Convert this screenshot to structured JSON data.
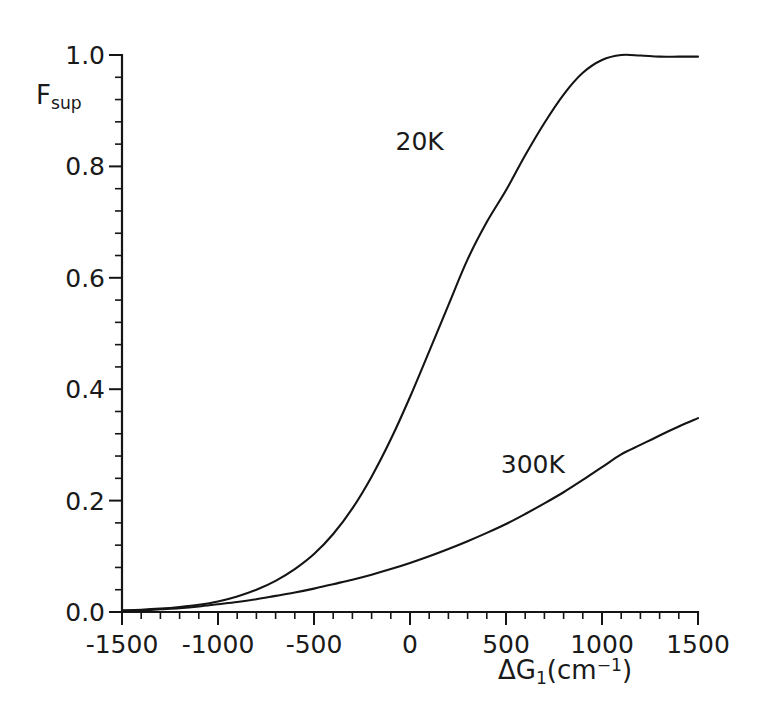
{
  "chart_data": {
    "type": "line",
    "title": "",
    "subtitle": "",
    "xlabel_parts": {
      "base_a": "ΔG",
      "sub_1": "1",
      "base_b": "(cm",
      "sup_neg1": "−1",
      "base_c": ")"
    },
    "xlabel": "ΔG₁(cm⁻¹)",
    "ylabel_parts": {
      "base": "F",
      "sub": "sup"
    },
    "ylabel": "F_sup",
    "xlim": [
      -1500,
      1500
    ],
    "ylim": [
      0.0,
      1.0
    ],
    "xticks": [
      -1500,
      -1000,
      -500,
      0,
      500,
      1000,
      1500
    ],
    "xtick_labels": [
      "-1500",
      "-1000",
      "-500",
      "0",
      "500",
      "1000",
      "1500"
    ],
    "yticks": [
      0.0,
      0.2,
      0.4,
      0.6,
      0.8,
      1.0
    ],
    "ytick_labels": [
      "0.0",
      "0.2",
      "0.4",
      "0.6",
      "0.8",
      "1.0"
    ],
    "x_minor_per_major": 5,
    "y_minor_per_major": 5,
    "grid": false,
    "legend_position": "inline-annotation",
    "tick_direction": "out",
    "spines": [
      "left",
      "bottom"
    ],
    "series": [
      {
        "name": "20K",
        "color": "#141414",
        "annotation": {
          "text": "20K",
          "x": 50,
          "y": 0.845
        },
        "x": [
          -1500,
          -1400,
          -1300,
          -1200,
          -1100,
          -1000,
          -900,
          -800,
          -700,
          -600,
          -500,
          -400,
          -300,
          -200,
          -100,
          0,
          100,
          200,
          300,
          400,
          500,
          600,
          700,
          800,
          900,
          1000,
          1100,
          1200,
          1300,
          1400,
          1500
        ],
        "y": [
          0.003,
          0.004,
          0.006,
          0.009,
          0.013,
          0.019,
          0.028,
          0.04,
          0.056,
          0.077,
          0.104,
          0.14,
          0.186,
          0.243,
          0.31,
          0.386,
          0.468,
          0.551,
          0.633,
          0.7,
          0.757,
          0.82,
          0.878,
          0.929,
          0.968,
          0.991,
          1.0,
          0.999,
          0.997,
          0.997,
          0.997
        ]
      },
      {
        "name": "300K",
        "color": "#141414",
        "annotation": {
          "text": "300K",
          "x": 640,
          "y": 0.265
        },
        "x": [
          -1500,
          -1400,
          -1300,
          -1200,
          -1100,
          -1000,
          -900,
          -800,
          -700,
          -600,
          -500,
          -400,
          -300,
          -200,
          -100,
          0,
          100,
          200,
          300,
          400,
          500,
          600,
          700,
          800,
          900,
          1000,
          1100,
          1200,
          1300,
          1400,
          1500
        ],
        "y": [
          0.002,
          0.003,
          0.005,
          0.007,
          0.01,
          0.014,
          0.018,
          0.023,
          0.029,
          0.035,
          0.042,
          0.05,
          0.058,
          0.067,
          0.077,
          0.088,
          0.1,
          0.113,
          0.127,
          0.142,
          0.158,
          0.176,
          0.195,
          0.215,
          0.237,
          0.26,
          0.283,
          0.3,
          0.317,
          0.333,
          0.348
        ]
      }
    ]
  }
}
